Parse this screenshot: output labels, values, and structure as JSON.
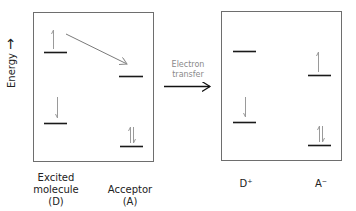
{
  "axis": {
    "label": "Energy",
    "arrow": "→"
  },
  "process": {
    "label_line1": "Electron",
    "label_line2": "transfer"
  },
  "left_panel": {
    "donor": {
      "line1": "Excited",
      "line2": "molecule",
      "line3": "(D)"
    },
    "acceptor": {
      "line1": "Acceptor",
      "line2": "(A)"
    }
  },
  "right_panel": {
    "donor_cation": "D⁺",
    "acceptor_anion": "A⁻"
  },
  "colors": {
    "frame": "#6e6e6e",
    "level": "#1a1a1a",
    "electron": "#9a9a9a",
    "transfer_arrow": "#7a7a7a",
    "main_arrow": "#111111"
  }
}
